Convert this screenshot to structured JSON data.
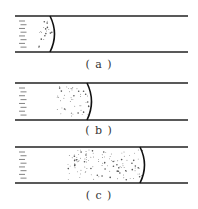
{
  "panels": [
    {
      "id": "a",
      "label": "( a )",
      "top": 16,
      "bottom": 52,
      "meniscus_x": 50,
      "particle_start": 38,
      "label_y": 58
    },
    {
      "id": "b",
      "label": "( b )",
      "top": 83,
      "bottom": 120,
      "meniscus_x": 87,
      "particle_start": 57,
      "label_y": 124
    },
    {
      "id": "c",
      "label": "( c )",
      "top": 147,
      "bottom": 183,
      "meniscus_x": 140,
      "particle_start": 68,
      "label_y": 189
    }
  ],
  "tube": {
    "x_start": 15,
    "x_end": 188,
    "line_color": "#222222",
    "line_width": 1.6
  },
  "colors": {
    "dash": "#666666",
    "particle": "#555555",
    "meniscus": "#111111"
  }
}
